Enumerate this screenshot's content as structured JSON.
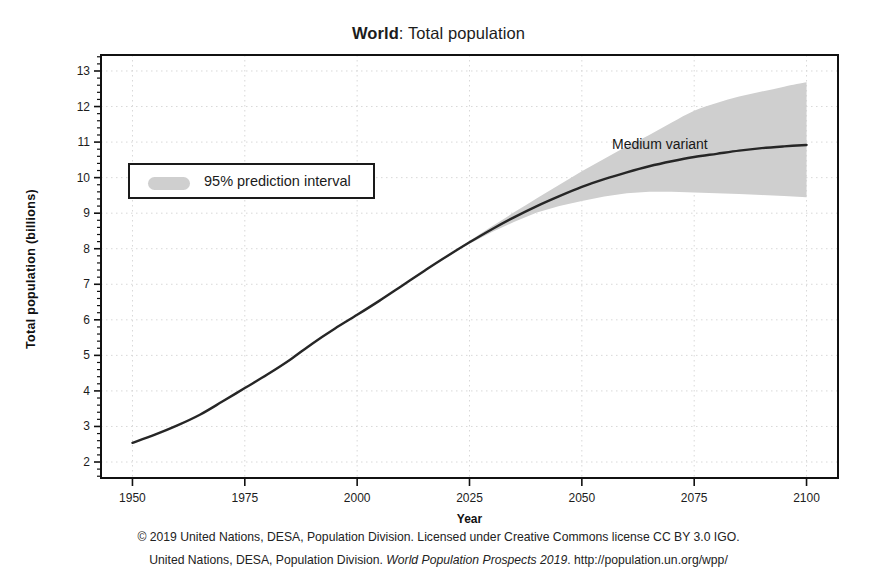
{
  "figure": {
    "title_bold": "World",
    "title_rest": ": Total population",
    "annotation": "Medium variant",
    "legend_label": "95% prediction interval",
    "caption_line_1": "© 2019 United Nations, DESA, Population Division. Licensed under Creative Commons license CC BY 3.0 IGO.",
    "caption_line_2_a": "United Nations, DESA, Population Division. ",
    "caption_line_2_italic": "World Population Prospects 2019",
    "caption_line_2_b": ". http://population.un.org/wpp/"
  },
  "colors": {
    "line": "#262626",
    "band": "#cfcfcf",
    "axis": "#111111",
    "grid": "#d8d8d8",
    "background": "#ffffff"
  },
  "chart_data": {
    "type": "line",
    "title": "World: Total population",
    "xlabel": "Year",
    "ylabel": "Total population (billions)",
    "xlim": [
      1943,
      2107
    ],
    "ylim": [
      1.55,
      13.45
    ],
    "xticks": [
      1950,
      1975,
      2000,
      2025,
      2050,
      2075,
      2100
    ],
    "yticks": [
      2,
      3,
      4,
      5,
      6,
      7,
      8,
      9,
      10,
      11,
      12,
      13
    ],
    "xtick_labels": [
      "1950",
      "1975",
      "2000",
      "2025",
      "2050",
      "2075",
      "2100"
    ],
    "ytick_labels": [
      "2",
      "3",
      "4",
      "5",
      "6",
      "7",
      "8",
      "9",
      "10",
      "11",
      "12",
      "13"
    ],
    "grid": true,
    "legend_position": "upper left",
    "annotations": [
      {
        "text": "Medium variant",
        "x": 2063,
        "y": 10.9
      }
    ],
    "series": [
      {
        "name": "Medium variant",
        "kind": "line",
        "x": [
          1950,
          1955,
          1960,
          1965,
          1970,
          1975,
          1980,
          1985,
          1990,
          1995,
          2000,
          2005,
          2010,
          2015,
          2019,
          2025,
          2030,
          2035,
          2040,
          2045,
          2050,
          2055,
          2060,
          2065,
          2070,
          2075,
          2080,
          2085,
          2090,
          2095,
          2100
        ],
        "values": [
          2.54,
          2.77,
          3.03,
          3.33,
          3.7,
          4.08,
          4.46,
          4.87,
          5.33,
          5.75,
          6.14,
          6.54,
          6.96,
          7.38,
          7.71,
          8.18,
          8.55,
          8.89,
          9.2,
          9.48,
          9.74,
          9.96,
          10.15,
          10.32,
          10.46,
          10.58,
          10.67,
          10.76,
          10.83,
          10.88,
          10.92
        ]
      },
      {
        "name": "95% prediction interval upper",
        "kind": "band-upper",
        "x": [
          2020,
          2025,
          2030,
          2035,
          2040,
          2045,
          2050,
          2055,
          2060,
          2065,
          2070,
          2075,
          2080,
          2085,
          2090,
          2095,
          2100
        ],
        "values": [
          7.8,
          8.22,
          8.63,
          9.03,
          9.42,
          9.8,
          10.18,
          10.53,
          10.88,
          11.2,
          11.55,
          11.88,
          12.1,
          12.28,
          12.42,
          12.56,
          12.68
        ]
      },
      {
        "name": "95% prediction interval lower",
        "kind": "band-lower",
        "x": [
          2020,
          2025,
          2030,
          2035,
          2040,
          2045,
          2050,
          2055,
          2060,
          2065,
          2070,
          2075,
          2080,
          2085,
          2090,
          2095,
          2100
        ],
        "values": [
          7.78,
          8.14,
          8.47,
          8.76,
          9.02,
          9.2,
          9.34,
          9.47,
          9.56,
          9.6,
          9.6,
          9.58,
          9.56,
          9.54,
          9.51,
          9.48,
          9.45
        ]
      }
    ]
  }
}
